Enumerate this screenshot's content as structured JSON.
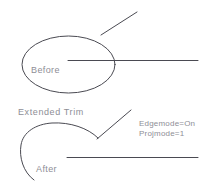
{
  "diagram": {
    "title": "Extended  Trim",
    "background_color": "#ffffff",
    "line_color": "#4a4a52",
    "text_color": "#8e8e96",
    "labels": {
      "before": "Before",
      "after": "After"
    },
    "notes": {
      "line1": "Edgemode=On",
      "line2": "Projmode=1"
    },
    "shapes": {
      "before_ellipse": "ellipse",
      "before_diagonal": "cutting-edge-line",
      "before_horizontal": "object-line",
      "after_arc": "trimmed-ellipse-arc",
      "after_diagonal": "cutting-edge-line",
      "after_horizontal": "object-line"
    }
  }
}
